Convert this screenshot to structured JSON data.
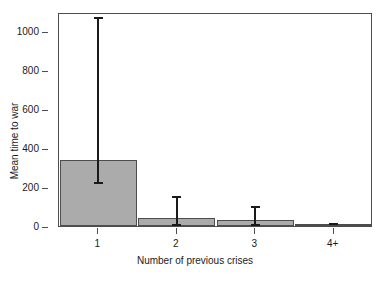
{
  "chart_data": {
    "type": "bar",
    "title": "",
    "subtitle": "",
    "xlabel": "Number of previous crises",
    "ylabel": "Mean time to war",
    "categories": [
      "1",
      "2",
      "3",
      "4+"
    ],
    "values": [
      340,
      40,
      30,
      10
    ],
    "error_low": [
      220,
      5,
      5,
      8
    ],
    "error_high": [
      1065,
      150,
      95,
      12
    ],
    "ylim": [
      0,
      1095
    ],
    "yticks": [
      0,
      200,
      400,
      600,
      800,
      1000
    ],
    "ytick_labels": [
      "0",
      "200",
      "400",
      "600",
      "800",
      "1000"
    ],
    "grid": false,
    "legend": null,
    "legend_position": "none",
    "bar_fill_color": "#ababab",
    "bar_edge_color": "#4d4d4d",
    "errorbar_color": "#1a1a1a",
    "frame_color": "#4d4d4d",
    "background_color": "#ffffff",
    "annotations": []
  }
}
